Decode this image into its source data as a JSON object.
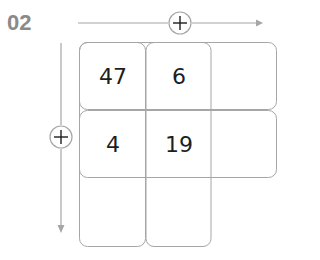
{
  "figure": {
    "label": "02",
    "label_color": "#8a8a8a",
    "line_color": "#a6a6a6",
    "text_color": "#1e1e1e",
    "horizontal_axis": {
      "icon": "plus-circle-icon",
      "direction": "right"
    },
    "vertical_axis": {
      "icon": "plus-circle-icon",
      "direction": "down"
    },
    "grid": {
      "rows": [
        [
          "47",
          "6",
          ""
        ],
        [
          "4",
          "19",
          ""
        ]
      ],
      "extra_row_columns": 2
    }
  }
}
